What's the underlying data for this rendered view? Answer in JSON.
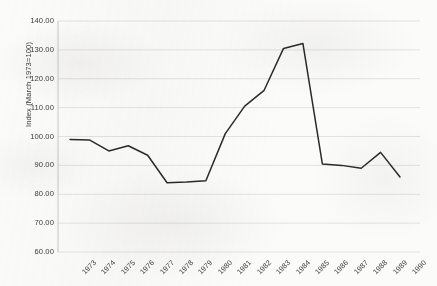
{
  "chart_data": {
    "type": "line",
    "title": "",
    "subtitle": "",
    "xlabel": "",
    "ylabel": "Index (March 1973=100)",
    "categories": [
      "1973",
      "1974",
      "1975",
      "1976",
      "1977",
      "1978",
      "1979",
      "1980",
      "1981",
      "1982",
      "1983",
      "1984",
      "1985",
      "1986",
      "1987",
      "1988",
      "1989",
      "1990"
    ],
    "x": [
      1973,
      1974,
      1975,
      1976,
      1977,
      1978,
      1979,
      1980,
      1981,
      1982,
      1983,
      1984,
      1985,
      1986,
      1987,
      1988,
      1989,
      1990
    ],
    "values": [
      99.0,
      98.8,
      95.0,
      96.8,
      93.5,
      84.0,
      84.2,
      84.7,
      101.0,
      110.5,
      116.0,
      130.5,
      132.2,
      90.5,
      90.0,
      89.0,
      94.5,
      86.0
    ],
    "series": [
      {
        "name": "Index (March 1973=100)",
        "values": [
          99.0,
          98.8,
          95.0,
          96.8,
          93.5,
          84.0,
          84.2,
          84.7,
          101.0,
          110.5,
          116.0,
          130.5,
          132.2,
          90.5,
          90.0,
          89.0,
          94.5,
          86.0
        ]
      }
    ],
    "ylim": [
      60,
      140
    ],
    "y_ticks": [
      60,
      70,
      80,
      90,
      100,
      110,
      120,
      130,
      140
    ],
    "y_tick_labels": [
      "60.00",
      "70.00",
      "80.00",
      "90.00",
      "100.00",
      "110.00",
      "120.00",
      "130.00",
      "140.00"
    ],
    "grid": true,
    "grid_axis": "y",
    "legend": false,
    "legend_position": "none",
    "line_color": "#2b2b2b",
    "grid_color": "#e2e2e0",
    "axis_color": "#c8c8c6",
    "background_color": "#fbfbfa",
    "text_color": "#3a3a3a",
    "markers": false,
    "annotations": []
  }
}
